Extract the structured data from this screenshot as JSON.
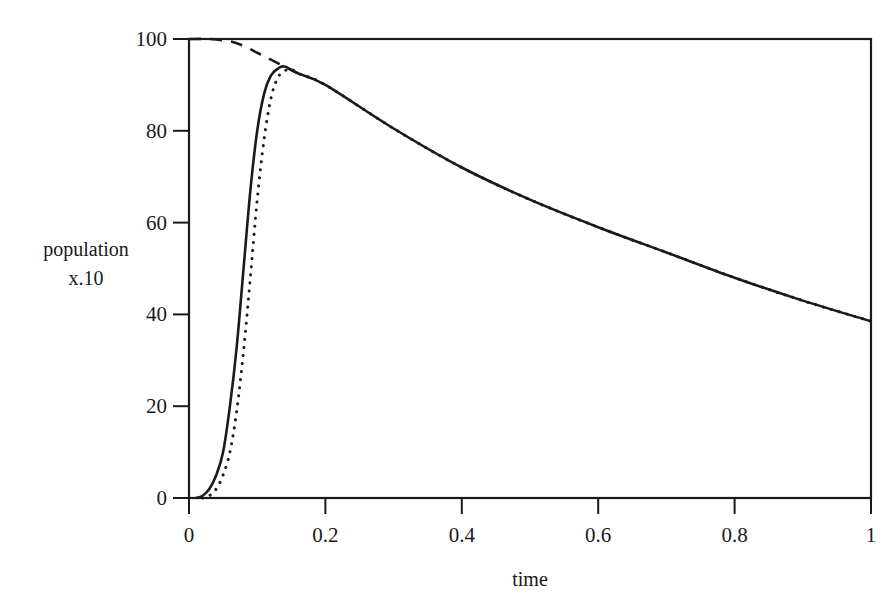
{
  "chart_data": {
    "type": "line",
    "title": "",
    "xlabel": "time",
    "ylabel": "population x.10",
    "ylabel_lines": [
      "population",
      "x.10"
    ],
    "xlim": [
      0,
      1
    ],
    "ylim": [
      0,
      100
    ],
    "xticks": [
      "0",
      "0.2",
      "0.4",
      "0.6",
      "0.8",
      "1"
    ],
    "yticks": [
      "0",
      "20",
      "40",
      "60",
      "80",
      "100"
    ],
    "grid": false,
    "legend": null,
    "series": [
      {
        "name": "solid",
        "style": "solid",
        "x": [
          0.01,
          0.02,
          0.03,
          0.04,
          0.05,
          0.06,
          0.07,
          0.08,
          0.09,
          0.1,
          0.11,
          0.12,
          0.13,
          0.14,
          0.16,
          0.2,
          0.3,
          0.4,
          0.5,
          0.6,
          0.7,
          0.8,
          0.9,
          1.0
        ],
        "y": [
          0,
          0.5,
          2,
          5,
          10,
          20,
          33,
          50,
          67,
          80,
          88,
          92,
          93.5,
          94,
          92.5,
          90,
          80.5,
          72,
          65,
          59,
          53.5,
          48,
          43,
          38.5
        ]
      },
      {
        "name": "dotted",
        "style": "dotted",
        "x": [
          0.02,
          0.03,
          0.04,
          0.05,
          0.06,
          0.07,
          0.08,
          0.09,
          0.1,
          0.11,
          0.12,
          0.13,
          0.14,
          0.15,
          0.16,
          0.2,
          0.3,
          0.4,
          0.5,
          0.6,
          0.7,
          0.8,
          0.9,
          1.0
        ],
        "y": [
          0,
          0.5,
          2,
          5,
          10,
          19,
          32,
          48,
          65,
          78,
          87,
          91.5,
          93,
          93.5,
          92.5,
          90,
          80.5,
          72,
          65,
          59,
          53.5,
          48,
          43,
          38.5
        ]
      },
      {
        "name": "dashed",
        "style": "dashed",
        "x": [
          0.0,
          0.03,
          0.06,
          0.08,
          0.1,
          0.12,
          0.14,
          0.16
        ],
        "y": [
          100,
          100,
          99.5,
          98.5,
          97,
          95.5,
          94,
          92.5
        ]
      }
    ]
  }
}
